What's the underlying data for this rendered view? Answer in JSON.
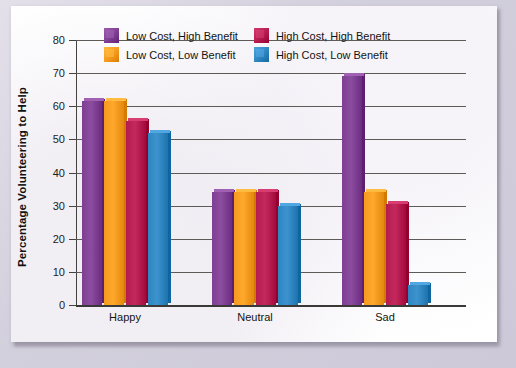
{
  "chart_data": {
    "type": "bar",
    "title": "",
    "subtitle": "",
    "xlabel": "",
    "ylabel": "Percentage Volunteering to Help",
    "ylim": [
      0,
      80
    ],
    "ytick_step": 10,
    "yticks": [
      "80",
      "70",
      "60",
      "50",
      "40",
      "30",
      "20",
      "10",
      "0"
    ],
    "grid": true,
    "grid_axis": "y",
    "legend_position": "top-center",
    "categories": [
      "Happy",
      "Neutral",
      "Sad"
    ],
    "series": [
      {
        "name": "Low Cost, High Benefit",
        "color": "#7e3f93",
        "values": [
          61.5,
          34,
          69
        ]
      },
      {
        "name": "Low Cost, Low Benefit",
        "color": "#f59a1e",
        "values": [
          61.5,
          34,
          34
        ]
      },
      {
        "name": "High Cost, High Benefit",
        "color": "#b51b4f",
        "values": [
          55.5,
          34,
          30.5
        ]
      },
      {
        "name": "High Cost, Low Benefit",
        "color": "#2e85c0",
        "values": [
          52,
          30,
          6
        ]
      }
    ]
  },
  "legend": {
    "entries": [
      {
        "label": "Low Cost, High Benefit"
      },
      {
        "label": "High Cost, High Benefit"
      },
      {
        "label": "Low Cost, Low Benefit"
      },
      {
        "label": "High Cost, Low Benefit"
      }
    ]
  },
  "colors": {
    "purple": "#7e3f93",
    "orange": "#f59a1e",
    "crimson": "#b51b4f",
    "blue": "#2e85c0",
    "axis": "#44413f",
    "grid": "#5d5a57",
    "card": "#ffffff",
    "frame": "#d5d1df"
  }
}
